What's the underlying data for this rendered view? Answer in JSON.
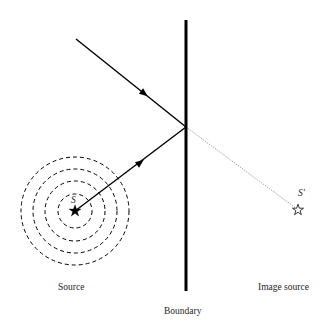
{
  "figure": {
    "title_caption_source": "Source",
    "title_caption_image_source": "Image source",
    "title_caption_boundary": "Boundary",
    "point_label_source": "S",
    "point_label_image_source": "S′"
  },
  "colors": {
    "ink": "#000000",
    "text": "#262626",
    "background": "#ffffff",
    "virtual_ray": "#7a7a7a"
  },
  "geometry": {
    "canvas": {
      "width": 336,
      "height": 325
    },
    "boundary_line": {
      "x": 186,
      "y_top": 20,
      "y_bottom": 291,
      "stroke_width": 3
    },
    "source_point": {
      "x": 75,
      "y": 211
    },
    "image_source_point": {
      "x": 298,
      "y": 210
    },
    "incidence_point": {
      "x": 186,
      "y": 127
    },
    "incident_ray": {
      "x1": 76,
      "y1": 39,
      "x2": 186,
      "y2": 127,
      "arrow_at": {
        "x": 139,
        "y": 88
      }
    },
    "reflected_ray": {
      "x1": 75,
      "y1": 211,
      "x2": 186,
      "y2": 127,
      "arrow_at": {
        "x": 137,
        "y": 164
      }
    },
    "virtual_ray": {
      "x1": 186,
      "y1": 127,
      "x2": 297,
      "y2": 209
    },
    "wavefront_circles": [
      {
        "cx": 75,
        "cy": 211,
        "r": 17
      },
      {
        "cx": 75,
        "cy": 211,
        "r": 30
      },
      {
        "cx": 75,
        "cy": 211,
        "r": 42
      },
      {
        "cx": 75,
        "cy": 211,
        "r": 54
      }
    ],
    "dash_pattern": "4 3"
  }
}
